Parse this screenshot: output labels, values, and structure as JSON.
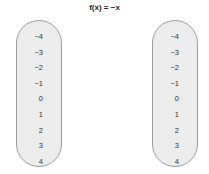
{
  "title": "f(x) = −x",
  "domain": {
    "label": "domain",
    "values": [
      "−4",
      "−3",
      "−2",
      "−1",
      "0",
      "1",
      "2",
      "3",
      "4"
    ]
  },
  "range": {
    "label": "range",
    "values": [
      "−4",
      "−3",
      "−2",
      "−1",
      "0",
      "1",
      "2",
      "3",
      "4"
    ]
  },
  "colors": {
    "oval_fill": "#ececec",
    "oval_border": "#9a9a9a"
  }
}
